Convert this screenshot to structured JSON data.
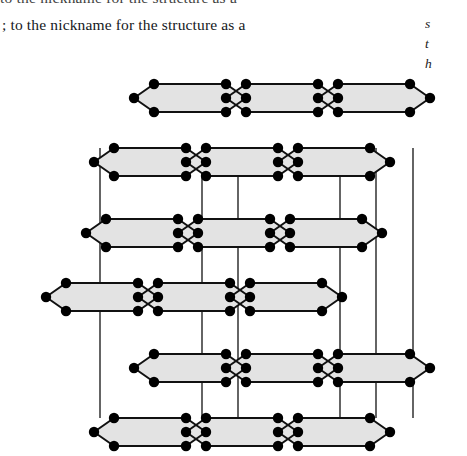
{
  "text": {
    "cut_off_line_above": "to the nickname for the structure as a",
    "body_line": "; to the nickname for the structure as a",
    "right_column_fragments": [
      "s",
      "t",
      "h"
    ],
    "figure_caption": ""
  },
  "figure": {
    "layer_count": 3,
    "layers": [
      {
        "name": "top-layer",
        "y_center": 60,
        "x_shift": 0,
        "hexagons": 6
      },
      {
        "name": "middle-layer",
        "y_center": 195,
        "x_shift": -48,
        "hexagons": 6
      },
      {
        "name": "bottom-layer",
        "y_center": 330,
        "x_shift": 0,
        "hexagons": 6
      }
    ],
    "colors": {
      "sheet_fill": "#e3e3e3",
      "bond_stroke": "#111111",
      "atom_fill": "#000000",
      "background": "#ffffff"
    },
    "geometry": {
      "hex_half_width": 56,
      "hex_half_height": 14,
      "hex_shoulder": 20,
      "atom_radius": 5.2,
      "bond_width": 2.0,
      "vertical_bond_width": 1.3
    },
    "vertical_bond_x": [
      100,
      202,
      238,
      340,
      376,
      413
    ]
  }
}
